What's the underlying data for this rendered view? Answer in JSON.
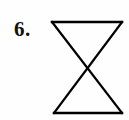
{
  "page": {
    "background_color": "#fefefe",
    "width": 129,
    "height": 120
  },
  "question": {
    "number_label": "6.",
    "number_color": "#111111"
  },
  "figure": {
    "name": "bowtie-hourglass",
    "stroke_color": "#000000",
    "stroke_width": 2.3,
    "fill": "none",
    "vertices": {
      "top_left": [
        52,
        22
      ],
      "top_right": [
        122,
        22
      ],
      "bottom_left": [
        54,
        113
      ],
      "bottom_right": [
        122,
        113
      ],
      "crossing_point": [
        88,
        68
      ]
    },
    "segments": [
      {
        "name": "top-edge",
        "from": [
          52,
          22
        ],
        "to": [
          122,
          22
        ]
      },
      {
        "name": "bottom-edge",
        "from": [
          54,
          113
        ],
        "to": [
          122,
          113
        ]
      },
      {
        "name": "diagonal-top-left-to-bottom-right",
        "from": [
          52,
          22
        ],
        "to": [
          122,
          113
        ]
      },
      {
        "name": "diagonal-top-right-to-bottom-left",
        "from": [
          122,
          22
        ],
        "to": [
          54,
          113
        ]
      }
    ]
  }
}
